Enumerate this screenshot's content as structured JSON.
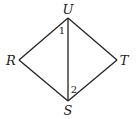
{
  "diagram": {
    "type": "geometry-figure",
    "colors": {
      "stroke": "#222222",
      "text": "#222222",
      "background": "#ffffff"
    },
    "vertices": {
      "U": {
        "label": "U",
        "x": 68,
        "y": 18
      },
      "R": {
        "label": "R",
        "x": 19,
        "y": 60
      },
      "T": {
        "label": "T",
        "x": 117,
        "y": 60
      },
      "S": {
        "label": "S",
        "x": 68,
        "y": 101
      }
    },
    "segments": [
      "UR",
      "RS",
      "UT",
      "TS",
      "US"
    ],
    "angles": [
      {
        "label": "1",
        "at": "U",
        "between": [
          "UR",
          "US"
        ]
      },
      {
        "label": "2",
        "at": "S",
        "between": [
          "SU",
          "ST"
        ]
      }
    ]
  }
}
